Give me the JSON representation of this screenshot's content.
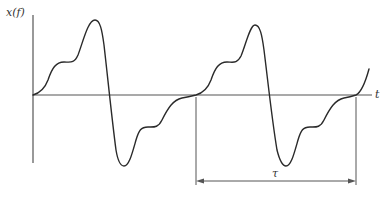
{
  "figure": {
    "type": "periodic-waveform",
    "y_axis_label": "x(f)",
    "x_axis_label": "t",
    "period_label": "τ",
    "colors": {
      "curve": "#2a2a2a",
      "axis": "#555555",
      "dimension": "#555555",
      "background": "#ffffff"
    },
    "axes": {
      "origin": [
        33,
        95
      ],
      "y_axis_top": 15,
      "y_axis_bottom": 163,
      "x_axis_right": 372
    },
    "period_marker": {
      "start_x": 196,
      "end_x": 356,
      "line_y": 181,
      "left_tick_top": 97,
      "right_tick_top": 97,
      "tick_bottom": 185
    },
    "curve_path": "M33,95 C40,93 45,88 48,80 C52,68 56,62 64,62 C70,62 74,64 78,55 C83,42 88,20 95,20 C100,20 102,30 104,45 C108,80 112,120 116,150 C118,162 121,166 124,166 C129,166 132,154 136,140 C139,130 141,127 148,127 C154,127 158,128 162,120 C168,108 173,100 182,98 C188,97 192,96 196,95 C203,93 208,88 211,80 C215,68 219,62 227,62 C233,62 237,64 241,56 C246,44 250,25 255,25 C260,25 262,35 264,50 C268,82 272,120 277,150 C280,162 283,166 286,166 C291,166 294,154 298,140 C301,130 303,127 310,127 C316,127 320,128 324,120 C330,108 335,100 344,98 C350,97 353,96 356,95 C362,92 366,80 369,69"
  }
}
